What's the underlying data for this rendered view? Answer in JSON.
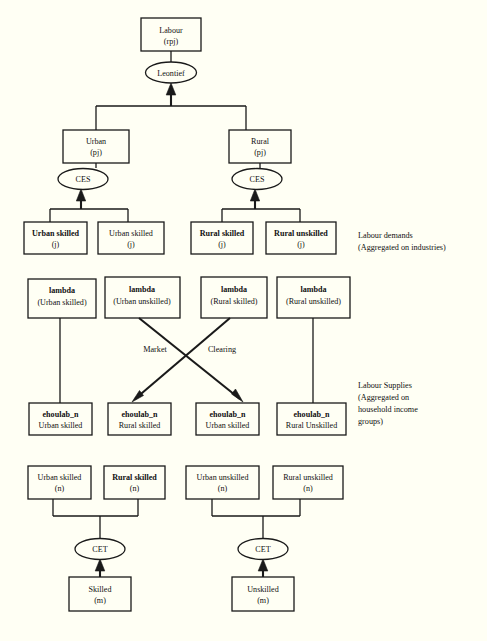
{
  "diagram": {
    "title_text": "Labour nesting structure",
    "background_color": "#fffff4",
    "line_color": "#1a1a1a",
    "type": "tree-diagram",
    "nodes": {
      "labour": {
        "line1": "Labour",
        "line2": "(rpj)"
      },
      "leontief": {
        "label": "Leontief"
      },
      "urban": {
        "line1": "Urban",
        "line2": "(pj)"
      },
      "rural": {
        "line1": "Rural",
        "line2": "(pj)"
      },
      "ces_left": {
        "label": "CES"
      },
      "ces_right": {
        "label": "CES"
      },
      "demand1": {
        "line1": "Urban skilled",
        "line2": "(j)"
      },
      "demand2": {
        "line1": "Urban  skilled",
        "line2": "(j)"
      },
      "demand3": {
        "line1": "Rural skilled",
        "line2": "(j)"
      },
      "demand4": {
        "line1": "Rural unskilled",
        "line2": "(j)"
      },
      "lambda1": {
        "line1": "lambda",
        "line2": "(Urban skilled)"
      },
      "lambda2": {
        "line1": "lambda",
        "line2": "(Urban unskilled)"
      },
      "lambda3": {
        "line1": "lambda",
        "line2": "(Rural skilled)"
      },
      "lambda4": {
        "line1": "lambda",
        "line2": "(Rural unskilled)"
      },
      "supply1": {
        "line1": "ehoulab_n",
        "line2": "Urban skilled"
      },
      "supply2": {
        "line1": "ehoulab_n",
        "line2": "Rural skilled"
      },
      "supply3": {
        "line1": "ehoulab_n",
        "line2": "Urban skilled"
      },
      "supply4": {
        "line1": "ehoulab_n",
        "line2": "Rural Unskilled"
      },
      "group1": {
        "line1": "Urban skilled",
        "line2": "(n)"
      },
      "group2": {
        "line1": "Rural skilled",
        "line2": "(n)"
      },
      "group3": {
        "line1": "Urban  unskilled",
        "line2": "(n)"
      },
      "group4": {
        "line1": "Rural unskilled",
        "line2": "(n)"
      },
      "cet_left": {
        "label": "CET"
      },
      "cet_right": {
        "label": "CET"
      },
      "skilled": {
        "line1": "Skilled",
        "line2": "(m)"
      },
      "unskilled": {
        "line1": "Unskilled",
        "line2": "(m)"
      }
    },
    "cross_labels": {
      "market": "Market",
      "clearing": "Clearing"
    },
    "annotations": {
      "demands": {
        "line1": "Labour demands",
        "line2": "(Aggregated on industries)"
      },
      "supplies": {
        "line1": "Labour Supplies",
        "line2": "(Aggregated on",
        "line3": "household income",
        "line4": "groups)"
      }
    }
  }
}
